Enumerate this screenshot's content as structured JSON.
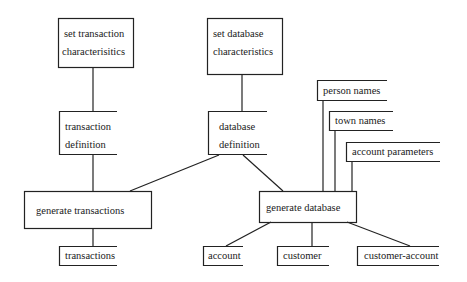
{
  "diagram": {
    "type": "flowchart",
    "nodes": [
      {
        "id": "set_tx",
        "lines": [
          "set transaction",
          "characterisitics"
        ]
      },
      {
        "id": "set_db",
        "lines": [
          "set database",
          "characteristics"
        ]
      },
      {
        "id": "tx_def",
        "lines": [
          "transaction",
          "definition"
        ]
      },
      {
        "id": "db_def",
        "lines": [
          "database",
          "definition"
        ]
      },
      {
        "id": "gen_tx",
        "lines": [
          "generate transactions"
        ]
      },
      {
        "id": "gen_db",
        "lines": [
          "generate database"
        ]
      },
      {
        "id": "transactions",
        "lines": [
          "transactions"
        ]
      },
      {
        "id": "account",
        "lines": [
          "account"
        ]
      },
      {
        "id": "customer",
        "lines": [
          "customer"
        ]
      },
      {
        "id": "customer_account",
        "lines": [
          "customer-account"
        ]
      },
      {
        "id": "person_names",
        "lines": [
          "person names"
        ]
      },
      {
        "id": "town_names",
        "lines": [
          "town names"
        ]
      },
      {
        "id": "account_params",
        "lines": [
          "account parameters"
        ]
      }
    ],
    "edges": [
      [
        "set_tx",
        "tx_def"
      ],
      [
        "set_db",
        "db_def"
      ],
      [
        "tx_def",
        "gen_tx"
      ],
      [
        "db_def",
        "gen_tx"
      ],
      [
        "db_def",
        "gen_db"
      ],
      [
        "gen_tx",
        "transactions"
      ],
      [
        "gen_db",
        "account"
      ],
      [
        "gen_db",
        "customer"
      ],
      [
        "gen_db",
        "customer_account"
      ],
      [
        "person_names",
        "gen_db"
      ],
      [
        "town_names",
        "gen_db"
      ],
      [
        "account_params",
        "gen_db"
      ]
    ]
  }
}
